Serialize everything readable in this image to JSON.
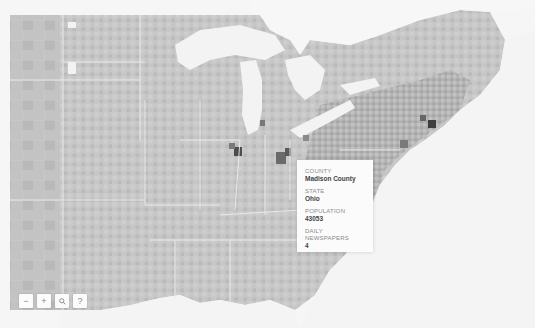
{
  "map": {
    "type": "choropleth",
    "subject": "US counties - Midwest and Northeast",
    "colors": {
      "ocean": "#f4f4f4",
      "lake": "#f2f2f2",
      "land_light": "#d6d6d6",
      "land_mid": "#bdbdbd",
      "land_dark": "#8c8c8c",
      "land_darkest": "#4a4a4a",
      "border": "#eeeeee"
    }
  },
  "tooltip": {
    "county_label": "COUNTY",
    "county_value": "Madison County",
    "state_label": "STATE",
    "state_value": "Ohio",
    "population_label": "POPULATION",
    "population_value": "43053",
    "newspapers_label": "DAILY NEWSPAPERS",
    "newspapers_value": "4"
  },
  "controls": {
    "zoom_out": "−",
    "zoom_in": "+",
    "search": "🔍",
    "help": "?"
  }
}
